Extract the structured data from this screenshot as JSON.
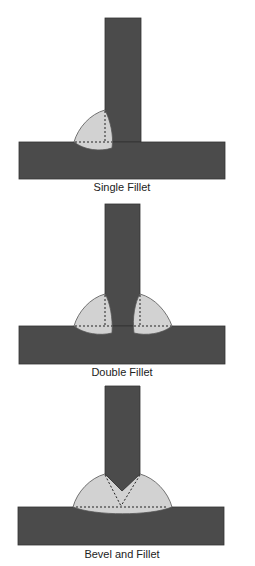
{
  "diagrams": [
    {
      "caption": "Single Fillet"
    },
    {
      "caption": "Double Fillet"
    },
    {
      "caption": "Bevel and Fillet"
    }
  ],
  "colors": {
    "plate": "#4b4b4b",
    "plate_edge": "#333333",
    "weld": "#d2d2d2",
    "weld_edge": "#555555",
    "dash": "#222222"
  }
}
